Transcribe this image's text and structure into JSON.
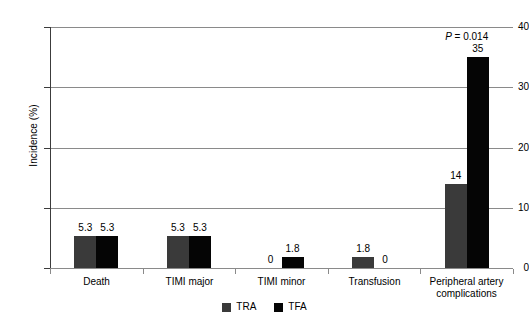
{
  "chart_data": {
    "type": "bar",
    "title": "",
    "xlabel": "",
    "ylabel": "Incidence (%)",
    "ylim": [
      0,
      40
    ],
    "yticks": [
      0,
      10,
      20,
      30,
      40
    ],
    "ytick_labels": [
      "0",
      "10",
      "20",
      "30",
      "40"
    ],
    "grid": true,
    "legend_position": "bottom-center",
    "categories": [
      "Death",
      "TIMI major",
      "TIMI minor",
      "Transfusion",
      "Peripheral artery complications"
    ],
    "category_lines": [
      [
        "Death"
      ],
      [
        "TIMI major"
      ],
      [
        "TIMI minor"
      ],
      [
        "Transfusion"
      ],
      [
        "Peripheral artery",
        "complications"
      ]
    ],
    "series": [
      {
        "name": "TRA",
        "color": "#3a3a3a",
        "values": [
          5.3,
          5.3,
          0,
          1.8,
          14
        ],
        "labels": [
          "5.3",
          "5.3",
          "0",
          "1.8",
          "14"
        ]
      },
      {
        "name": "TFA",
        "color": "#050505",
        "values": [
          5.3,
          5.3,
          1.8,
          0,
          35
        ],
        "labels": [
          "5.3",
          "5.3",
          "1.8",
          "0",
          "35"
        ]
      }
    ],
    "annotations": [
      {
        "symbol": "P",
        "text": " = 0.014",
        "full_text": "P = 0.014",
        "category": "Peripheral artery complications"
      }
    ]
  },
  "legend": {
    "entries": [
      {
        "label": "TRA",
        "color": "#3a3a3a"
      },
      {
        "label": "TFA",
        "color": "#050505"
      }
    ]
  },
  "colors": {
    "tra": "#3a3a3a",
    "tfa": "#050505",
    "gridline": "#8a8a8a",
    "axis": "#3c3c3c",
    "background": "#ffffff"
  }
}
